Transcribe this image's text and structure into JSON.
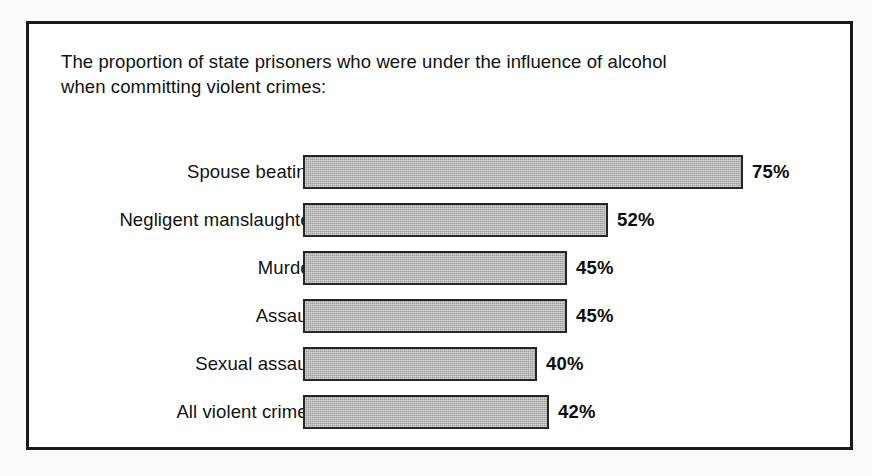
{
  "figure": {
    "title": "The proportion of state prisoners who were under the influence of alcohol\nwhen committing violent crimes:"
  },
  "chart_data": {
    "type": "bar",
    "orientation": "horizontal",
    "title": "The proportion of state prisoners who were under the influence of alcohol when committing violent crimes:",
    "xlabel": "",
    "ylabel": "",
    "xlim": [
      0,
      75
    ],
    "grid": false,
    "legend": null,
    "value_suffix": "%",
    "categories": [
      "Spouse beating",
      "Negligent manslaughter",
      "Murder",
      "Assault",
      "Sexual assault",
      "All violent crimes"
    ],
    "values": [
      75,
      52,
      45,
      45,
      40,
      42
    ],
    "value_labels": [
      "75%",
      "52%",
      "45%",
      "45%",
      "40%",
      "42%"
    ],
    "bar_fill_color": "#aeaeae",
    "bar_border_color": "#262626",
    "px_per_unit": 5.86
  }
}
